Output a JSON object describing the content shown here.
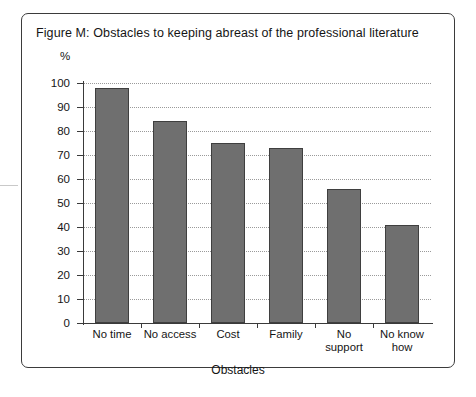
{
  "figure": {
    "title": "Figure M: Obstacles to keeping abreast of the professional literature",
    "unit_label": "%"
  },
  "chart_data": {
    "type": "bar",
    "title": "Figure M: Obstacles to keeping abreast of the professional literature",
    "categories": [
      "No time",
      "No access",
      "Cost",
      "Family",
      "No\nsupport",
      "No know\nhow"
    ],
    "values": [
      98,
      84,
      75,
      73,
      56,
      41
    ],
    "xlabel": "Obstacles",
    "ylabel": "%",
    "ylim": [
      0,
      100
    ],
    "ytick_labels": [
      "0",
      "10",
      "20",
      "30",
      "40",
      "50",
      "60",
      "70",
      "80",
      "90",
      "100"
    ],
    "ytick_values": [
      0,
      10,
      20,
      30,
      40,
      50,
      60,
      70,
      80,
      90,
      100
    ],
    "grid": true,
    "legend": "none",
    "bar_color": "#6f6f6f",
    "bar_border_color": "#3f3f3f",
    "axis_color": "#3a3a3a",
    "frame_color": "#3b3b3b"
  }
}
